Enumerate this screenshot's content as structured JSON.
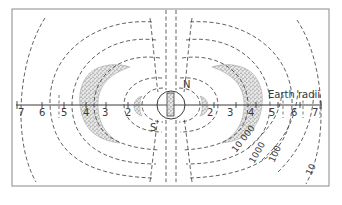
{
  "diagram": {
    "type": "magnetosphere-radiation-belts",
    "axis_label": "Earth radii",
    "axis_ticks_left": [
      "7",
      "6",
      "5",
      "4",
      "3",
      "2"
    ],
    "axis_ticks_right": [
      "2",
      "3",
      "4",
      "5",
      "6",
      "7"
    ],
    "pole_labels": {
      "north": "N",
      "south": "S"
    },
    "contour_labels": [
      "10 000",
      "1000",
      "100",
      "10"
    ],
    "colors": {
      "line": "#3a3a3a",
      "frame": "#8a8a8a",
      "background": "#ffffff",
      "belt_fill": "#cfcfcf"
    }
  }
}
